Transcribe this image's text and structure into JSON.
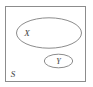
{
  "diagram": {
    "type": "set-diagram",
    "background_color": "#ffffff",
    "stroke_color": "#8c8c8c",
    "text_color": "#3c3c3c",
    "universal_set": {
      "name": "universal-set",
      "shape": "rectangle",
      "label": "S",
      "label_position": "bottom-left",
      "x": 5,
      "y": 6,
      "width": 81,
      "height": 76
    },
    "sets": [
      {
        "name": "set-x",
        "shape": "ellipse",
        "label": "X",
        "label_position": "left-inside",
        "cx": 49,
        "cy": 33,
        "rx": 33,
        "ry": 15.5,
        "label_x": 27,
        "label_y": 33
      },
      {
        "name": "set-y",
        "shape": "ellipse",
        "label": "Y",
        "label_position": "center",
        "cx": 58.5,
        "cy": 61,
        "rx": 14.5,
        "ry": 7,
        "label_x": 58.5,
        "label_y": 64
      }
    ],
    "labels": {
      "universal": "S",
      "set_one": "X",
      "set_two": "Y"
    }
  }
}
